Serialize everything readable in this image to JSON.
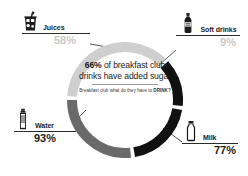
{
  "center": {
    "headline_pct": "66%",
    "headline_rest": " of breakfast club drinks have added sugar",
    "subtitle_lead": "Breakfast club what do they have to ",
    "subtitle_strong": "DRINK?"
  },
  "palette": {
    "juices": "#cfcfcf",
    "soft_drinks": "#111111",
    "milk": "#111111",
    "water": "#6a6a6a",
    "text_dark": "#1b1b1b",
    "text_light": "#c9c9c9",
    "background": "#ffffff"
  },
  "callouts": [
    {
      "key": "juices",
      "label": "Juices",
      "percent": "58%",
      "icon": "juice-cup-icon",
      "value_color": "#c9c9c9"
    },
    {
      "key": "soft_drinks",
      "label": "Soft drinks",
      "percent": "9%",
      "icon": "soda-bottle-icon",
      "value_color": "#c9c9c9"
    },
    {
      "key": "water",
      "label": "Water",
      "percent": "93%",
      "icon": "water-bottle-icon",
      "value_color": "#1b1b1b"
    },
    {
      "key": "milk",
      "label": "Milk",
      "percent": "77%",
      "icon": "milk-bottle-icon",
      "value_color": "#1b1b1b"
    }
  ],
  "chart_data": {
    "type": "pie",
    "title": "66% of breakfast club drinks have added sugar",
    "subtitle": "Breakfast club what do they have to DRINK?",
    "variant": "donut",
    "categories": [
      "Juices",
      "Soft drinks",
      "Milk",
      "Water"
    ],
    "values": [
      58,
      9,
      77,
      93
    ],
    "value_labels": [
      "58%",
      "9%",
      "77%",
      "93%"
    ],
    "colors": [
      "#cfcfcf",
      "#111111",
      "#111111",
      "#6a6a6a"
    ],
    "ring_segments_deg": [
      {
        "name": "Juices",
        "start": -86,
        "end": 44,
        "color": "#cfcfcf"
      },
      {
        "name": "Soft drinks",
        "start": 48,
        "end": 96,
        "color": "#111111"
      },
      {
        "name": "Milk",
        "start": 100,
        "end": 170,
        "color": "#111111"
      },
      {
        "name": "Water",
        "start": 174,
        "end": 270,
        "color": "#6a6a6a"
      }
    ],
    "legend": "callout labels around the ring",
    "grid": false,
    "xlabel": "",
    "ylabel": ""
  }
}
